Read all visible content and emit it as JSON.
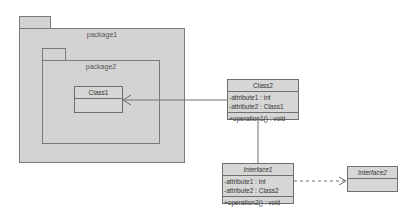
{
  "diagram": {
    "type": "UML class diagram",
    "packages": [
      {
        "id": "package1",
        "name": "package1"
      },
      {
        "id": "package2",
        "name": "package2",
        "parent": "package1"
      }
    ],
    "classes": {
      "class1": {
        "name": "Class1",
        "attributes": [],
        "operations": []
      },
      "class2": {
        "name": "Class2",
        "attributes": [
          "-attribute1 : int",
          "-attribute2 : Class1"
        ],
        "operations": [
          "+operation1() : void"
        ]
      },
      "interface1": {
        "name": "Interface1",
        "attributes": [
          "-attribute1 : int",
          "-attribute2 : Class2"
        ],
        "operations": [
          "+operation2() : void"
        ]
      },
      "interface2": {
        "name": "Interface2",
        "attributes": [],
        "operations": []
      }
    },
    "relationships": [
      {
        "from": "Class2",
        "to": "Class1",
        "type": "directed association"
      },
      {
        "from": "Class2",
        "to": "Interface1",
        "type": "association"
      },
      {
        "from": "Interface1",
        "to": "Interface2",
        "type": "dependency (dashed)"
      }
    ],
    "colors": {
      "fill": "#d3d3d3",
      "border": "#7a7a7a",
      "line": "#6e6e6e"
    }
  }
}
